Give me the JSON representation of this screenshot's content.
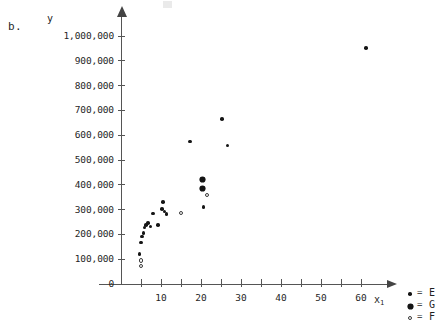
{
  "figure": {
    "panel_label": "b.",
    "y_axis_title": "y",
    "x_axis_title_base": "x",
    "x_axis_title_sub": "1"
  },
  "legend": {
    "equals": "=",
    "entries": [
      {
        "marker": "filled-dot",
        "label": "E"
      },
      {
        "marker": "star",
        "label": "G"
      },
      {
        "marker": "open-circle",
        "label": "F"
      }
    ]
  },
  "chart_data": {
    "type": "scatter",
    "title": "",
    "xlabel": "x1",
    "ylabel": "y",
    "xlim": [
      0,
      65
    ],
    "ylim": [
      0,
      1000000
    ],
    "grid": false,
    "legend_position": "bottom-right",
    "x_ticks_major": [
      10,
      20,
      30,
      40,
      50,
      60
    ],
    "x_ticks_minor": [
      5,
      15,
      25,
      35,
      45,
      55
    ],
    "x_tick_labels": [
      "10",
      "20",
      "30",
      "40",
      "50",
      "60"
    ],
    "y_ticks": [
      0,
      100000,
      200000,
      300000,
      400000,
      500000,
      600000,
      700000,
      800000,
      900000,
      1000000
    ],
    "y_tick_labels": [
      "0",
      "100,000",
      "200,000",
      "300,000",
      "400,000",
      "500,000",
      "600,000",
      "700,000",
      "800,000",
      "900,000",
      "1,000,000"
    ],
    "series": [
      {
        "name": "E",
        "marker": "filled-dot",
        "points": [
          [
            4.6,
            120000
          ],
          [
            5.0,
            168000
          ],
          [
            5.3,
            192000
          ],
          [
            5.6,
            205000
          ],
          [
            5.9,
            228000
          ],
          [
            6.3,
            238000
          ],
          [
            6.8,
            247000
          ],
          [
            7.4,
            232000
          ],
          [
            8.0,
            285000
          ],
          [
            9.2,
            238000
          ],
          [
            10.2,
            303000
          ],
          [
            10.5,
            330000
          ],
          [
            10.9,
            292000
          ],
          [
            11.4,
            282000
          ],
          [
            17.3,
            575000
          ],
          [
            20.6,
            310000
          ],
          [
            25.2,
            665000
          ],
          [
            26.6,
            558000
          ],
          [
            61.2,
            952000
          ]
        ]
      },
      {
        "name": "G",
        "marker": "star",
        "points": [
          [
            20.3,
            420000
          ],
          [
            20.4,
            385000
          ]
        ]
      },
      {
        "name": "F",
        "marker": "open-circle",
        "points": [
          [
            5.0,
            72000
          ],
          [
            5.0,
            95000
          ],
          [
            15.1,
            285000
          ],
          [
            21.4,
            358000
          ]
        ]
      }
    ]
  }
}
